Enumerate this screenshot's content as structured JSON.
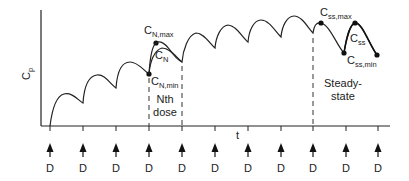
{
  "diagram": {
    "type": "pharmacokinetic-multiple-dosing",
    "y_axis_label": "C",
    "y_axis_label_sub": "p",
    "x_axis_label": "t",
    "dose_label": "D",
    "dose_count": 11,
    "annotations": {
      "cn_max": {
        "main": "C",
        "sub": "N,max"
      },
      "cn": {
        "main": "C",
        "sub": "N"
      },
      "cn_min": {
        "main": "C",
        "sub": "N,min"
      },
      "nth_dose_line1": "Nth",
      "nth_dose_line2": "dose",
      "css_max": {
        "main": "C",
        "sub": "ss,max"
      },
      "css": {
        "main": "C",
        "sub": "ss"
      },
      "css_min": {
        "main": "C",
        "sub": "ss,min"
      },
      "steady_state_line1": "Steady-",
      "steady_state_line2": "state"
    },
    "colors": {
      "line": "#222222",
      "background": "#ffffff"
    }
  },
  "chart_data": {
    "type": "line",
    "title": "",
    "xlabel": "t",
    "ylabel": "Cp",
    "dose_times": [
      1,
      2,
      3,
      4,
      5,
      6,
      7,
      8,
      9,
      10,
      11
    ],
    "peaks_relative": [
      0.3,
      0.48,
      0.6,
      0.7,
      0.78,
      0.82,
      0.85,
      0.87,
      0.89,
      0.89
    ],
    "troughs_relative": [
      0.0,
      0.18,
      0.33,
      0.45,
      0.55,
      0.61,
      0.65,
      0.68,
      0.7,
      0.7,
      0.69
    ],
    "grid": false
  }
}
